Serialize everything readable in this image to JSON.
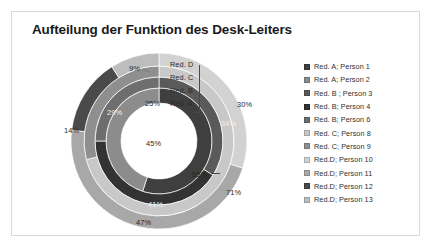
{
  "chart_frame": {
    "border_color": "#d9d9d9"
  },
  "title": "Aufteilung der Funktion des Desk-Leiters",
  "ring_labels": {
    "d": "Red. D",
    "c": "Red. C",
    "b": "Red. B",
    "a": "Red. A"
  },
  "legend": {
    "items": [
      {
        "label": "Red. A; Person 1",
        "color": "#3f3f3f"
      },
      {
        "label": "Red. A; Person 2",
        "color": "#8c8c8c"
      },
      {
        "label": "Red. B ; Person 3",
        "color": "#5a5a5a"
      },
      {
        "label": "Red. B; Person 4",
        "color": "#333333"
      },
      {
        "label": "Red. B; Person 6",
        "color": "#6e6e6e"
      },
      {
        "label": "Red. C; Person 8",
        "color": "#c8c8c8"
      },
      {
        "label": "Red. C; Person 9",
        "color": "#8f8f8f"
      },
      {
        "label": "Red.D; Person 10",
        "color": "#d2d2d2"
      },
      {
        "label": "Red.D; Person 11",
        "color": "#a8a8a8"
      },
      {
        "label": "Red.D; Person 12",
        "color": "#4a4a4a"
      },
      {
        "label": "Red.D; Person 13",
        "color": "#bdbdbd"
      }
    ]
  },
  "chart_data": {
    "type": "pie",
    "title": "Aufteilung der Funktion des Desk-Leiters",
    "subtitle": "",
    "xlabel": "",
    "ylabel": "",
    "legend_position": "right",
    "grid": false,
    "rings": [
      {
        "name": "Red. A",
        "ring_index": 1,
        "position": "inner",
        "slices": [
          {
            "label": "Red. A; Person 1",
            "value": 55,
            "data_label": "55%",
            "color": "#3f3f3f"
          },
          {
            "label": "Red. A; Person 2",
            "value": 45,
            "data_label": "45%",
            "color": "#8c8c8c"
          }
        ]
      },
      {
        "name": "Red. B",
        "ring_index": 2,
        "slices": [
          {
            "label": "Red. B ; Person 3",
            "value": 34,
            "data_label": "34%",
            "color": "#5a5a5a"
          },
          {
            "label": "Red. B; Person 4",
            "value": 41,
            "data_label": "41%",
            "color": "#333333"
          },
          {
            "label": "Red. B; Person 6",
            "value": 25,
            "data_label": "25%",
            "color": "#6e6e6e"
          }
        ]
      },
      {
        "name": "Red. C",
        "ring_index": 3,
        "slices": [
          {
            "label": "Red. C; Person 8",
            "value": 71,
            "data_label": "71%",
            "color": "#c8c8c8"
          },
          {
            "label": "Red. C; Person 9",
            "value": 29,
            "data_label": "29%",
            "color": "#8f8f8f"
          }
        ]
      },
      {
        "name": "Red. D",
        "ring_index": 4,
        "position": "outer",
        "slices": [
          {
            "label": "Red.D; Person 10",
            "value": 30,
            "data_label": "30%",
            "color": "#d2d2d2"
          },
          {
            "label": "Red.D; Person 11",
            "value": 47,
            "data_label": "47%",
            "color": "#a8a8a8"
          },
          {
            "label": "Red.D; Person 12",
            "value": 14,
            "data_label": "14%",
            "color": "#4a4a4a"
          },
          {
            "label": "Red.D; Person 13",
            "value": 9,
            "data_label": "9%",
            "color": "#bdbdbd"
          }
        ]
      }
    ],
    "data_labels": [
      "9%",
      "30%",
      "25%",
      "34%",
      "29%",
      "14%",
      "45%",
      "55%",
      "71%",
      "41%",
      "47%"
    ]
  },
  "pct": {
    "p9": "9%",
    "p30": "30%",
    "p25": "25%",
    "p34": "34%",
    "p29": "29%",
    "p14": "14%",
    "p45": "45%",
    "p55": "55%",
    "p71": "71%",
    "p41": "41%",
    "p47": "47%"
  }
}
